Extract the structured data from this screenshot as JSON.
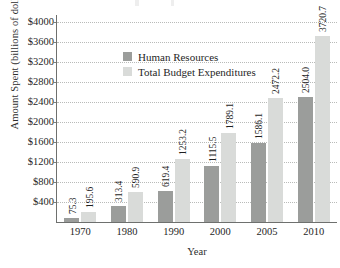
{
  "chart_data": {
    "type": "bar",
    "title": "",
    "xlabel": "Year",
    "ylabel": "Amount Spent (billions of dollars)",
    "categories": [
      "1970",
      "1980",
      "1990",
      "2000",
      "2005",
      "2010"
    ],
    "series": [
      {
        "name": "Human Resources",
        "color": "#9b9d9b",
        "values": [
          75.3,
          313.4,
          619.4,
          1115.5,
          1586.1,
          2504.0
        ],
        "labels": [
          "75.3",
          "313.4",
          "619.4",
          "1115.5",
          "1586.1",
          "2504.0"
        ]
      },
      {
        "name": "Total Budget Expenditures",
        "color": "#d9dbd9",
        "values": [
          195.6,
          590.9,
          1253.2,
          1789.1,
          2472.2,
          3720.7
        ],
        "labels": [
          "195.6",
          "590.9",
          "1253.2",
          "1789.1",
          "2472.2",
          "3720.7"
        ]
      }
    ],
    "ylim": [
      0,
      4000
    ],
    "ytick_values": [
      400,
      800,
      1200,
      1600,
      2000,
      2400,
      2800,
      3200,
      3600,
      4000
    ],
    "ytick_labels": [
      "$400",
      "$800",
      "$1200",
      "$1600",
      "$2000",
      "$2400",
      "$2800",
      "$3200",
      "$3600",
      "$4000"
    ],
    "grid": "horizontal-dotted",
    "legend_position": "top-left-inside",
    "legend_entries": [
      "Human Resources",
      "Total Budget Expenditures"
    ]
  },
  "axis": {
    "y_title": "Amount Spent (billions of dollars)",
    "x_title": "Year"
  },
  "colors": {
    "human_resources": "#9b9d9b",
    "total_budget": "#d9dbd9",
    "gridline": "#b9bbb9",
    "axis": "#6e706e",
    "text": "#1f1f1f",
    "background": "#ffffff"
  }
}
